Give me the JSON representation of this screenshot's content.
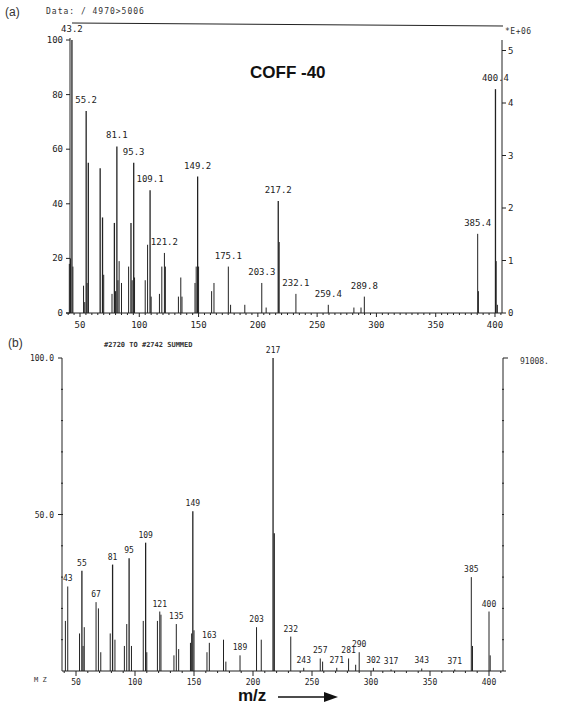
{
  "chart_data": [
    {
      "id": "a",
      "type": "bar",
      "panel_label": "(a)",
      "header": "Data: / 4970>5006",
      "title": "COFF -40",
      "xlabel": "",
      "ylabel": "",
      "xlim": [
        40,
        410
      ],
      "ylim": [
        0,
        100
      ],
      "x_ticks": [
        50,
        100,
        150,
        200,
        250,
        300,
        350,
        400
      ],
      "y_ticks_left": [
        0,
        20,
        40,
        60,
        80,
        100
      ],
      "y_ticks_right": [
        0,
        1,
        2,
        3,
        4,
        5
      ],
      "right_axis_label": "*E+06",
      "grid": false,
      "peaks": [
        {
          "mz": 41,
          "rel": 18
        },
        {
          "mz": 42,
          "rel": 20
        },
        {
          "mz": 43.2,
          "rel": 100,
          "label": "43.2"
        },
        {
          "mz": 44,
          "rel": 17
        },
        {
          "mz": 53,
          "rel": 10
        },
        {
          "mz": 54,
          "rel": 4
        },
        {
          "mz": 55.2,
          "rel": 74,
          "label": "55.2"
        },
        {
          "mz": 56,
          "rel": 11
        },
        {
          "mz": 57,
          "rel": 55
        },
        {
          "mz": 67,
          "rel": 53
        },
        {
          "mz": 69,
          "rel": 35
        },
        {
          "mz": 70,
          "rel": 14
        },
        {
          "mz": 77,
          "rel": 7
        },
        {
          "mz": 79,
          "rel": 33
        },
        {
          "mz": 80,
          "rel": 8
        },
        {
          "mz": 81.1,
          "rel": 61,
          "label": "81.1"
        },
        {
          "mz": 82,
          "rel": 12
        },
        {
          "mz": 83,
          "rel": 19
        },
        {
          "mz": 85,
          "rel": 11
        },
        {
          "mz": 91,
          "rel": 17
        },
        {
          "mz": 93,
          "rel": 33
        },
        {
          "mz": 94,
          "rel": 12
        },
        {
          "mz": 95.3,
          "rel": 55,
          "label": "95.3"
        },
        {
          "mz": 96,
          "rel": 13
        },
        {
          "mz": 105,
          "rel": 12
        },
        {
          "mz": 107,
          "rel": 25
        },
        {
          "mz": 109.1,
          "rel": 45,
          "label": "109.1"
        },
        {
          "mz": 110,
          "rel": 6
        },
        {
          "mz": 117,
          "rel": 7
        },
        {
          "mz": 119,
          "rel": 17
        },
        {
          "mz": 121.2,
          "rel": 22,
          "label": "121.2"
        },
        {
          "mz": 122,
          "rel": 17
        },
        {
          "mz": 133,
          "rel": 6
        },
        {
          "mz": 135,
          "rel": 13
        },
        {
          "mz": 136,
          "rel": 6
        },
        {
          "mz": 147,
          "rel": 11
        },
        {
          "mz": 148,
          "rel": 17
        },
        {
          "mz": 149.2,
          "rel": 50,
          "label": "149.2"
        },
        {
          "mz": 150,
          "rel": 17
        },
        {
          "mz": 161,
          "rel": 8
        },
        {
          "mz": 163,
          "rel": 11
        },
        {
          "mz": 175.1,
          "rel": 17,
          "label": "175.1"
        },
        {
          "mz": 177,
          "rel": 3
        },
        {
          "mz": 189,
          "rel": 3
        },
        {
          "mz": 203.3,
          "rel": 11,
          "label": "203.3"
        },
        {
          "mz": 207,
          "rel": 2
        },
        {
          "mz": 217.2,
          "rel": 41,
          "label": "217.2"
        },
        {
          "mz": 218,
          "rel": 26
        },
        {
          "mz": 232.1,
          "rel": 7,
          "label": "232.1"
        },
        {
          "mz": 259.4,
          "rel": 3,
          "label": "259.4"
        },
        {
          "mz": 281,
          "rel": 2
        },
        {
          "mz": 287,
          "rel": 2
        },
        {
          "mz": 289.8,
          "rel": 6,
          "label": "289.8"
        },
        {
          "mz": 385.4,
          "rel": 29,
          "label": "385.4"
        },
        {
          "mz": 386,
          "rel": 8
        },
        {
          "mz": 400.4,
          "rel": 82,
          "label": "400.4"
        },
        {
          "mz": 401,
          "rel": 19
        },
        {
          "mz": 402,
          "rel": 3
        }
      ]
    },
    {
      "id": "b",
      "type": "bar",
      "panel_label": "(b)",
      "header": "#2720 TO #2742 SUMMED",
      "title": "",
      "xlabel": "m/z",
      "axis_corner_label": "M Z",
      "ylabel": "",
      "xlim": [
        38,
        410
      ],
      "ylim": [
        0,
        100
      ],
      "x_ticks": [
        50,
        100,
        150,
        200,
        250,
        300,
        350,
        400
      ],
      "y_ticks_left": [
        "50.0",
        "100.0"
      ],
      "max_intensity_label": "91008.",
      "grid": false,
      "peaks": [
        {
          "mz": 41,
          "rel": 16
        },
        {
          "mz": 43,
          "rel": 27,
          "label": "43"
        },
        {
          "mz": 53,
          "rel": 12
        },
        {
          "mz": 55,
          "rel": 32,
          "label": "55"
        },
        {
          "mz": 56,
          "rel": 8
        },
        {
          "mz": 57,
          "rel": 14
        },
        {
          "mz": 67,
          "rel": 22,
          "label": "67"
        },
        {
          "mz": 69,
          "rel": 20
        },
        {
          "mz": 71,
          "rel": 6
        },
        {
          "mz": 79,
          "rel": 12
        },
        {
          "mz": 81,
          "rel": 34,
          "label": "81"
        },
        {
          "mz": 83,
          "rel": 10
        },
        {
          "mz": 91,
          "rel": 8
        },
        {
          "mz": 93,
          "rel": 15
        },
        {
          "mz": 95,
          "rel": 36,
          "label": "95"
        },
        {
          "mz": 97,
          "rel": 8
        },
        {
          "mz": 107,
          "rel": 16
        },
        {
          "mz": 109,
          "rel": 41,
          "label": "109"
        },
        {
          "mz": 110,
          "rel": 6
        },
        {
          "mz": 119,
          "rel": 16
        },
        {
          "mz": 121,
          "rel": 19,
          "label": "121"
        },
        {
          "mz": 122,
          "rel": 18
        },
        {
          "mz": 133,
          "rel": 5
        },
        {
          "mz": 135,
          "rel": 15,
          "label": "135"
        },
        {
          "mz": 137,
          "rel": 7
        },
        {
          "mz": 147,
          "rel": 9
        },
        {
          "mz": 148,
          "rel": 12
        },
        {
          "mz": 149,
          "rel": 51,
          "label": "149"
        },
        {
          "mz": 150,
          "rel": 13
        },
        {
          "mz": 161,
          "rel": 6
        },
        {
          "mz": 163,
          "rel": 9,
          "label": "163"
        },
        {
          "mz": 175,
          "rel": 10
        },
        {
          "mz": 177,
          "rel": 3
        },
        {
          "mz": 189,
          "rel": 5,
          "label": "189"
        },
        {
          "mz": 203,
          "rel": 14,
          "label": "203"
        },
        {
          "mz": 207,
          "rel": 10
        },
        {
          "mz": 217,
          "rel": 100,
          "label": "217"
        },
        {
          "mz": 218,
          "rel": 44
        },
        {
          "mz": 232,
          "rel": 11,
          "label": "232"
        },
        {
          "mz": 243,
          "rel": 1,
          "label": "243"
        },
        {
          "mz": 257,
          "rel": 4,
          "label": "257"
        },
        {
          "mz": 259,
          "rel": 3
        },
        {
          "mz": 271,
          "rel": 1,
          "label": "271"
        },
        {
          "mz": 281,
          "rel": 4,
          "label": "281"
        },
        {
          "mz": 287,
          "rel": 2
        },
        {
          "mz": 290,
          "rel": 6,
          "label": "290"
        },
        {
          "mz": 302,
          "rel": 1,
          "label": "302"
        },
        {
          "mz": 317,
          "rel": 0.5,
          "label": "317"
        },
        {
          "mz": 343,
          "rel": 0.8,
          "label": "343"
        },
        {
          "mz": 371,
          "rel": 0.5,
          "label": "371"
        },
        {
          "mz": 385,
          "rel": 30,
          "label": "385"
        },
        {
          "mz": 386,
          "rel": 8
        },
        {
          "mz": 400,
          "rel": 19,
          "label": "400"
        },
        {
          "mz": 401,
          "rel": 5
        }
      ]
    }
  ],
  "labels": {
    "a_panel": "(a)",
    "a_header": "Data: / 4970>5006",
    "a_title": "COFF -40",
    "a_right_units": "*E+06",
    "b_panel": "(b)",
    "b_header": "#2720 TO #2742 SUMMED",
    "b_max": "91008.",
    "b_corner": "M Z",
    "b_xlabel": "m/z"
  },
  "colors": {
    "ink": "#222222",
    "background": "#ffffff"
  }
}
